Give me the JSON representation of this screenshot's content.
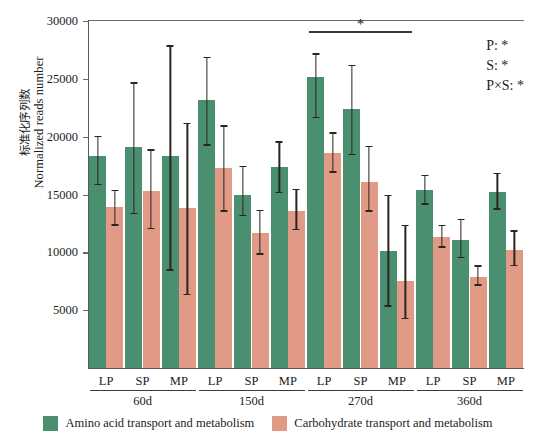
{
  "chart_data": {
    "type": "bar",
    "title": "",
    "xlabel": "",
    "ylabel": "标准化序列数 / Normalized reads number",
    "ylabel_cn": "标准化序列数",
    "ylabel_en": "Normalized reads number",
    "ylim": [
      0,
      30000
    ],
    "ytick_values": [
      5000,
      10000,
      15000,
      20000,
      25000,
      30000
    ],
    "ytick_labels": [
      "5000",
      "10000",
      "15000",
      "20000",
      "25000",
      "30000"
    ],
    "grid": false,
    "legend_position": "bottom-center",
    "groups": [
      "60d",
      "150d",
      "270d",
      "360d"
    ],
    "subcategories": [
      "LP",
      "SP",
      "MP"
    ],
    "categories": [
      "60d LP",
      "60d SP",
      "60d MP",
      "150d LP",
      "150d SP",
      "150d MP",
      "270d LP",
      "270d SP",
      "270d MP",
      "360d LP",
      "360d SP",
      "360d MP"
    ],
    "series": [
      {
        "name": "Amino acid transport and metabolism",
        "color": "#4a9070",
        "values": [
          18300,
          19100,
          18300,
          23200,
          15000,
          17400,
          25200,
          22400,
          10100,
          15400,
          11100,
          15200
        ],
        "err_low": [
          15800,
          13300,
          8400,
          19200,
          13100,
          15100,
          21600,
          18400,
          5300,
          14100,
          9500,
          13700
        ],
        "err_high": [
          20100,
          24700,
          27900,
          26900,
          17500,
          19600,
          27200,
          26200,
          15000,
          16700,
          12900,
          16900
        ]
      },
      {
        "name": "Carbohydrate transport and metabolism",
        "color": "#e09a85",
        "values": [
          13900,
          15300,
          13800,
          17300,
          11700,
          13600,
          18600,
          16100,
          7500,
          11300,
          7900,
          10200
        ],
        "err_low": [
          12300,
          12000,
          6300,
          13500,
          9800,
          11900,
          16900,
          13500,
          4200,
          10400,
          7100,
          8800
        ],
        "err_high": [
          15400,
          18900,
          21200,
          21000,
          13700,
          15500,
          20400,
          19200,
          12400,
          12400,
          8900,
          11900
        ]
      }
    ],
    "significance_bracket": {
      "label": "*",
      "from_category": "270d LP",
      "to_category": "270d MP",
      "y_value": 29100
    },
    "annotations": [
      {
        "label": "P:",
        "value": "*"
      },
      {
        "label": "S:",
        "value": "*"
      },
      {
        "label": "P×S:",
        "value": "*"
      }
    ]
  },
  "legend": {
    "items": [
      {
        "label": "Amino acid transport and metabolism",
        "color": "#4a9070"
      },
      {
        "label": "Carbohydrate transport and metabolism",
        "color": "#e09a85"
      }
    ]
  }
}
